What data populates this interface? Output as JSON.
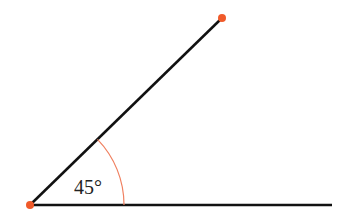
{
  "diagram": {
    "angle_label": "45°",
    "angle_degrees": 45,
    "colors": {
      "line": "#111111",
      "point": "#f05a2a",
      "arc": "#f08060"
    },
    "points": {
      "vertex": [
        30,
        205
      ],
      "ray_end": [
        222,
        18
      ],
      "base_end": [
        332,
        205
      ]
    }
  }
}
